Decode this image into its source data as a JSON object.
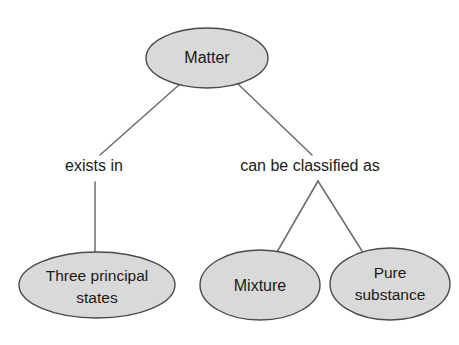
{
  "diagram": {
    "type": "concept-map",
    "background_color": "#ffffff",
    "node_fill_color": "#d9d9d9",
    "node_stroke_color": "#4a4a4a",
    "edge_color": "#6b6b6b",
    "text_color": "#1a1a1a",
    "nodes": [
      {
        "id": "matter",
        "label": "Matter",
        "lines": [
          "Matter"
        ],
        "cx": 207,
        "cy": 58,
        "rx": 61,
        "ry": 30
      },
      {
        "id": "three-principal-states",
        "label": "Three principal states",
        "lines": [
          "Three principal",
          "states"
        ],
        "cx": 97,
        "cy": 285,
        "rx": 78,
        "ry": 33
      },
      {
        "id": "mixture",
        "label": "Mixture",
        "lines": [
          "Mixture"
        ],
        "cx": 260,
        "cy": 285,
        "rx": 60,
        "ry": 35
      },
      {
        "id": "pure-substance",
        "label": "Pure substance",
        "lines": [
          "Pure",
          "substance"
        ],
        "cx": 390,
        "cy": 284,
        "rx": 60,
        "ry": 36
      }
    ],
    "edge_labels": [
      {
        "id": "exists-in",
        "label": "exists in",
        "x": 94,
        "y": 167
      },
      {
        "id": "can-be-classified-as",
        "label": "can be classified as",
        "x": 310,
        "y": 167
      }
    ],
    "edges": [
      {
        "id": "matter-to-exists-in",
        "from": "matter",
        "to": "exists-in"
      },
      {
        "id": "exists-in-to-three-principal-states",
        "from": "exists-in",
        "to": "three-principal-states"
      },
      {
        "id": "matter-to-can-be-classified-as",
        "from": "matter",
        "to": "can-be-classified-as"
      },
      {
        "id": "classified-to-mixture",
        "from": "can-be-classified-as",
        "to": "mixture"
      },
      {
        "id": "classified-to-pure-substance",
        "from": "can-be-classified-as",
        "to": "pure-substance"
      }
    ]
  }
}
